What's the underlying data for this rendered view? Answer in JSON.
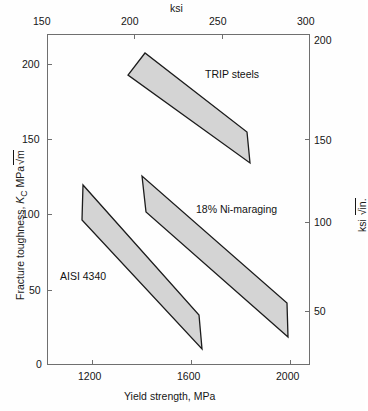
{
  "chart_data": {
    "type": "area",
    "title": "",
    "xlabel": "Yield strength, MPa",
    "ylabel": "Fracture toughness, K_C MPa√m",
    "x2label": "ksi",
    "y2label": "ksi √in.",
    "xlim": [
      1000,
      2100
    ],
    "ylim": [
      0,
      220
    ],
    "x2lim": [
      150,
      300
    ],
    "y2lim": [
      0,
      200
    ],
    "grid": false,
    "legend": "inline-annotations",
    "xticks": [
      "1200",
      "1600",
      "2000"
    ],
    "xtick_values": [
      1200,
      1600,
      2000
    ],
    "yticks": [
      "0",
      "50",
      "100",
      "150",
      "200"
    ],
    "ytick_values": [
      0,
      50,
      100,
      150,
      200
    ],
    "x2ticks": [
      "150",
      "200",
      "250",
      "300"
    ],
    "x2tick_values": [
      150,
      200,
      250,
      300
    ],
    "y2ticks": [
      "50",
      "100",
      "150",
      "200"
    ],
    "y2tick_values": [
      50,
      100,
      150,
      200
    ],
    "series": [
      {
        "name": "TRIP steels",
        "fill": "#d4d4d4",
        "stroke": "#1c1c1c",
        "band_x_range_mpa": [
          1340,
          1800
        ],
        "band_y_range_mpa_sqrt_m": [
          95,
          205
        ],
        "polygon_px": "145,53 128,75 250,163 247,132",
        "label_x_px": 205,
        "label_y_px": 75
      },
      {
        "name": "18% Ni-maraging",
        "fill": "#d4d4d4",
        "stroke": "#1c1c1c",
        "band_x_range_mpa": [
          1320,
          1970
        ],
        "band_y_range_mpa_sqrt_m": [
          28,
          125
        ],
        "polygon_px": "142,176 146,212 288,337 287,303",
        "label_x_px": 196,
        "label_y_px": 210
      },
      {
        "name": "AISI 4340",
        "fill": "#d4d4d4",
        "stroke": "#1c1c1c",
        "band_x_range_mpa": [
          1080,
          1640
        ],
        "band_y_range_mpa_sqrt_m": [
          20,
          120
        ],
        "polygon_px": "83,185 82,220 202,349 199,315",
        "label_x_px": 88,
        "label_y_px": 277
      }
    ]
  },
  "axes": {
    "left_title_main": "Fracture toughness, ",
    "left_title_k": "K",
    "left_title_c": "C",
    "left_title_units": " MPa",
    "left_title_radical": "√m",
    "right_title_units": "ksi ",
    "right_title_radical": "√in.",
    "top_title": "ksi",
    "bottom_title": "Yield strength, MPa"
  }
}
